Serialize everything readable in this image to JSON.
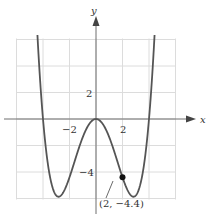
{
  "chart_data": {
    "type": "line",
    "title": "",
    "xlabel": "x",
    "ylabel": "y",
    "xlim": [
      -6,
      6
    ],
    "ylim": [
      -6,
      6
    ],
    "grid": true,
    "grid_step": 2,
    "x_tick_labels": [
      {
        "value": -2,
        "label": "−2"
      },
      {
        "value": 2,
        "label": "2"
      }
    ],
    "y_tick_labels": [
      {
        "value": 2,
        "label": "2"
      },
      {
        "value": -4,
        "label": "−4"
      }
    ],
    "series": [
      {
        "name": "f(x)",
        "equation_estimate": "y = 0.0917x^4 - 1.467x^2",
        "x": [
          -4.4,
          -4.0,
          -3.5,
          -3.0,
          -2.83,
          -2.5,
          -2.0,
          -1.5,
          -1.0,
          -0.5,
          0,
          0.5,
          1.0,
          1.5,
          2.0,
          2.5,
          2.83,
          3.0,
          3.5,
          4.0,
          4.4
        ],
        "values": [
          5.8,
          0.0,
          -4.2,
          -5.78,
          -5.87,
          -5.59,
          -4.4,
          -2.84,
          -1.38,
          -0.36,
          0,
          -0.36,
          -1.38,
          -2.84,
          -4.4,
          -5.59,
          -5.87,
          -5.78,
          -4.2,
          0.0,
          5.8
        ]
      }
    ],
    "annotations": [
      {
        "x": 2,
        "y": -4.4,
        "label": "(2, −4.4)",
        "marker": "filled-circle"
      }
    ]
  },
  "labels": {
    "x_axis": "x",
    "y_axis": "y",
    "tick_x_neg2": "−2",
    "tick_x_2": "2",
    "tick_y_2": "2",
    "tick_y_neg4": "−4",
    "point_label": "(2, −4.4)"
  }
}
